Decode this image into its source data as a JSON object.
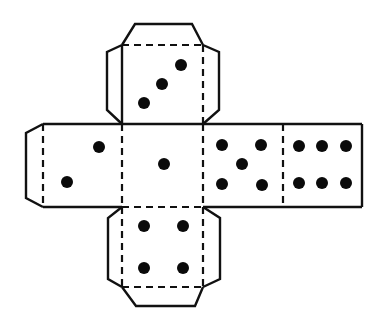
{
  "diagram": {
    "colors": {
      "line": "#111111",
      "pip": "#0a0a0a",
      "background": "#ffffff"
    },
    "faces": [
      {
        "name": "top",
        "value": 3,
        "label": "3"
      },
      {
        "name": "left",
        "value": 2,
        "label": "2"
      },
      {
        "name": "center",
        "value": 1,
        "label": "1"
      },
      {
        "name": "right",
        "value": 5,
        "label": "5"
      },
      {
        "name": "far-right",
        "value": 6,
        "label": "6"
      },
      {
        "name": "bottom",
        "value": 4,
        "label": "4"
      }
    ],
    "legend": {
      "solid": "cut line",
      "dashed": "fold line"
    }
  }
}
